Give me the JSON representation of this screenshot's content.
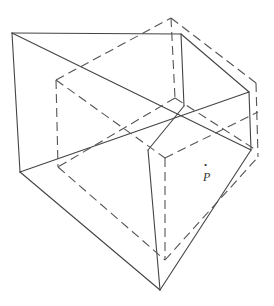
{
  "diagram": {
    "point_label": "P",
    "point_marker": "•",
    "colors": {
      "line": "#444444",
      "background": "#ffffff"
    },
    "solid_edges": [
      [
        12,
        33,
        181,
        34
      ],
      [
        12,
        33,
        20,
        172
      ],
      [
        12,
        33,
        160,
        290
      ],
      [
        181,
        34,
        249,
        92
      ],
      [
        181,
        34,
        184,
        106
      ],
      [
        20,
        172,
        184,
        106
      ],
      [
        20,
        172,
        160,
        290
      ],
      [
        249,
        92,
        184,
        106
      ],
      [
        249,
        92,
        251,
        150
      ],
      [
        184,
        106,
        251,
        150
      ],
      [
        148,
        150,
        160,
        290
      ],
      [
        251,
        150,
        160,
        290
      ],
      [
        56,
        80,
        249,
        92
      ]
    ],
    "dashed_edges": [
      [
        56,
        80,
        171,
        18
      ],
      [
        171,
        18,
        256,
        83
      ],
      [
        171,
        18,
        175,
        98
      ],
      [
        56,
        80,
        58,
        167
      ],
      [
        56,
        80,
        155,
        165
      ],
      [
        58,
        167,
        175,
        98
      ],
      [
        175,
        98,
        258,
        157
      ],
      [
        256,
        83,
        258,
        157
      ],
      [
        155,
        165,
        258,
        157
      ],
      [
        155,
        165,
        165,
        260
      ],
      [
        58,
        167,
        165,
        260
      ],
      [
        258,
        157,
        165,
        260
      ],
      [
        20,
        172,
        155,
        100
      ]
    ]
  }
}
